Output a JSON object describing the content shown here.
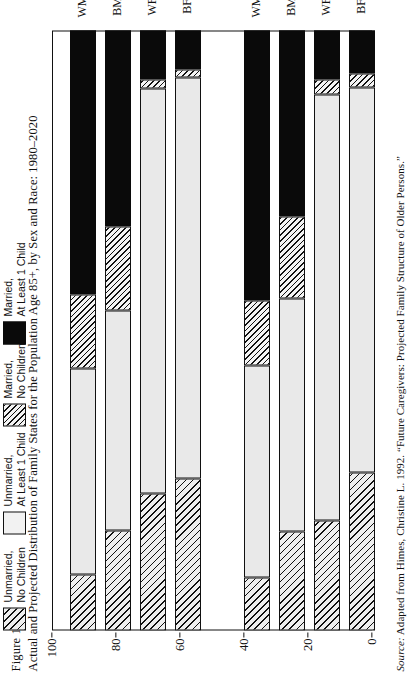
{
  "figure": {
    "number": "Figure 19.6",
    "title": "Actual and Projected Distribution of Family States for the Population Age 85+, by Sex and Race: 1980–2020",
    "source_prefix": "Source:",
    "source_text": " Adapted from Himes, Christine L. 1992. “Future Caregivers: Projected Family Structure of Older Persons.”"
  },
  "legend": {
    "position": "above-plot",
    "items": [
      {
        "key": "unmar-nokid",
        "line1": "Unmarried,",
        "line2": "No Children"
      },
      {
        "key": "unmar-kid",
        "line1": "Unmarried,",
        "line2": "At Least 1 Child"
      },
      {
        "key": "mar-nokid",
        "line1": "Married,",
        "line2": "No Children"
      },
      {
        "key": "mar-kid",
        "line1": "Married,",
        "line2": "At Least 1 Child"
      }
    ]
  },
  "chart_data": {
    "type": "bar",
    "orientation": "vertical-stacked-100",
    "title": "Actual and Projected Distribution of Family States for the Population Age 85+, by Sex and Race: 1980–2020",
    "xlabel": "",
    "ylabel": "Percentage",
    "ylim": [
      0,
      100
    ],
    "yticks": [
      0,
      20,
      40,
      60,
      80,
      100
    ],
    "grid": false,
    "groups": [
      "1980",
      "2000",
      "2020"
    ],
    "categories": [
      "WM",
      "BM",
      "WF",
      "BF"
    ],
    "series": [
      {
        "name": "Married, At Least 1 Child",
        "key": "mar-kid",
        "values": {
          "1980": [
            44.0,
            32.6,
            8.1,
            6.5
          ],
          "2000": [
            45.0,
            31.0,
            8.1,
            7.2
          ],
          "2020": [
            47.9,
            41.4,
            14.3,
            7.2
          ]
        }
      },
      {
        "name": "Married, No Children",
        "key": "mar-nokid",
        "values": {
          "1980": [
            12.4,
            14.0,
            1.6,
            1.3
          ],
          "2000": [
            10.9,
            13.7,
            2.6,
            2.3
          ],
          "2020": [
            4.9,
            9.4,
            0.7,
            0.7
          ]
        }
      },
      {
        "name": "Unmarried, At Least 1 Child",
        "key": "unmar-kid",
        "values": {
          "1980": [
            34.2,
            36.8,
            67.4,
            66.8
          ],
          "2000": [
            35.2,
            38.8,
            71.0,
            64.2
          ],
          "2020": [
            41.7,
            32.6,
            70.7,
            78.8
          ]
        }
      },
      {
        "name": "Unmarried, No Children",
        "key": "unmar-nokid",
        "values": {
          "1980": [
            9.4,
            16.6,
            22.9,
            25.4
          ],
          "2000": [
            8.9,
            16.5,
            18.3,
            26.3
          ],
          "2020": [
            5.5,
            16.6,
            14.3,
            13.3
          ]
        }
      }
    ]
  },
  "axis": {
    "tick_labels": [
      "0",
      "20",
      "40",
      "60",
      "80",
      "100"
    ],
    "y_axis_label": "Percentage"
  }
}
